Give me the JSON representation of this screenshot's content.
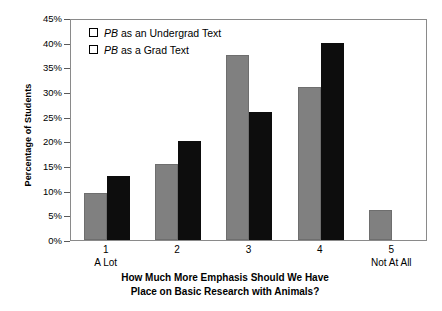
{
  "chart_data": {
    "type": "bar",
    "title": "",
    "xlabel": "How Much More Emphasis Should We Have Place on Basic Research with Animals?",
    "xlabel_line1": "How Much More Emphasis Should We Have",
    "xlabel_line2": "Place on Basic Research with Animals?",
    "ylabel": "Percentage of Students",
    "categories": [
      "1",
      "2",
      "3",
      "4",
      "5"
    ],
    "category_anchors": [
      "A Lot",
      "",
      "",
      "",
      "Not At All"
    ],
    "series": [
      {
        "name": "PB as an Undergrad Text",
        "name_italic_prefix": "PB",
        "name_rest": " as an Undergrad Text",
        "color": "#808080",
        "values": [
          9.5,
          15.5,
          37.5,
          31.0,
          6.0
        ]
      },
      {
        "name": "PB as a Grad Text",
        "name_italic_prefix": "PB",
        "name_rest": " as a Grad Text",
        "color": "#0d0d0d",
        "values": [
          13.0,
          20.0,
          26.0,
          40.0,
          0.0
        ]
      }
    ],
    "ylim": [
      0,
      45
    ],
    "ytick_values": [
      45,
      40,
      35,
      30,
      25,
      20,
      15,
      10,
      5,
      0
    ],
    "ytick_labels": [
      "45%",
      "40%",
      "35%",
      "30%",
      "25%",
      "20%",
      "15%",
      "10%",
      "5%",
      "0%"
    ],
    "grid": false,
    "legend_position": "top-left",
    "frame": true
  }
}
